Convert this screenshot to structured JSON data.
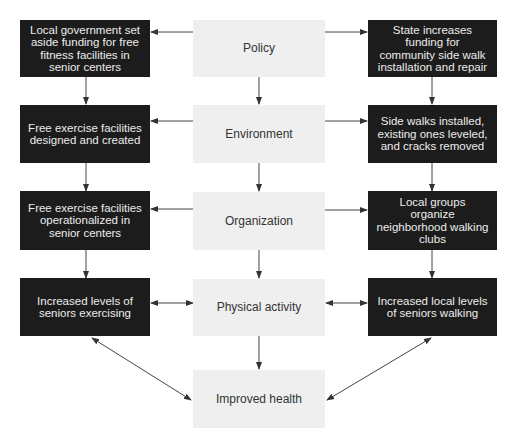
{
  "center": [
    {
      "id": "policy",
      "label": "Policy"
    },
    {
      "id": "environment",
      "label": "Environment"
    },
    {
      "id": "organization",
      "label": "Organization"
    },
    {
      "id": "physical_activity",
      "label": "Physical activity"
    },
    {
      "id": "improved_health",
      "label": "Improved health"
    }
  ],
  "left": [
    {
      "label": "Local government set aside funding for free fitness facilities in senior centers"
    },
    {
      "label": "Free exercise facilities designed and created"
    },
    {
      "label": "Free exercise facilities operationalized in senior centers"
    },
    {
      "label": "Increased levels of seniors exercising"
    }
  ],
  "right": [
    {
      "label": "State increases funding for community side walk installation and repair"
    },
    {
      "label": "Side walks installed, existing ones leveled, and cracks removed"
    },
    {
      "label": "Local groups organize neighborhood walking clubs"
    },
    {
      "label": "Increased local levels of seniors walking"
    }
  ],
  "colors": {
    "dark_box": "#1c1c1c",
    "light_box": "#efefef",
    "arrow": "#333333"
  }
}
